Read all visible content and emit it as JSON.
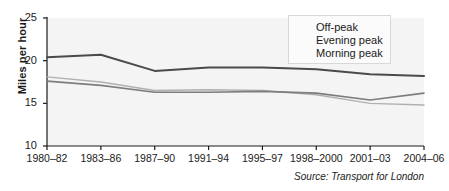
{
  "chart_data": {
    "type": "line",
    "title": "",
    "xlabel": "",
    "ylabel": "Miles per hour",
    "categories": [
      "1980–82",
      "1983–86",
      "1987–90",
      "1991–94",
      "1995–97",
      "1998–2000",
      "2001–03",
      "2004–06"
    ],
    "series": [
      {
        "name": "Off-peak",
        "color": "#4a4a4a",
        "width": 2.0,
        "values": [
          20.4,
          20.7,
          18.8,
          19.2,
          19.2,
          19.0,
          18.4,
          18.2
        ]
      },
      {
        "name": "Evening peak",
        "color": "#b0b0b0",
        "width": 1.4,
        "values": [
          18.1,
          17.5,
          16.5,
          16.6,
          16.5,
          16.0,
          15.0,
          14.8
        ]
      },
      {
        "name": "Morning peak",
        "color": "#7d7d7d",
        "width": 1.6,
        "values": [
          17.6,
          17.1,
          16.3,
          16.3,
          16.4,
          16.2,
          15.4,
          16.2
        ]
      }
    ],
    "ylim": [
      10,
      25
    ],
    "yticks": [
      10,
      15,
      20,
      25
    ],
    "grid": false,
    "legend_position": "top-right",
    "plot_background": "#f4f4f4",
    "annotations": [
      "Source: Transport for London"
    ]
  },
  "source": {
    "text": "Source: Transport for London"
  },
  "legend": {
    "items": [
      {
        "label": "Off-peak"
      },
      {
        "label": "Evening peak"
      },
      {
        "label": "Morning peak"
      }
    ]
  }
}
